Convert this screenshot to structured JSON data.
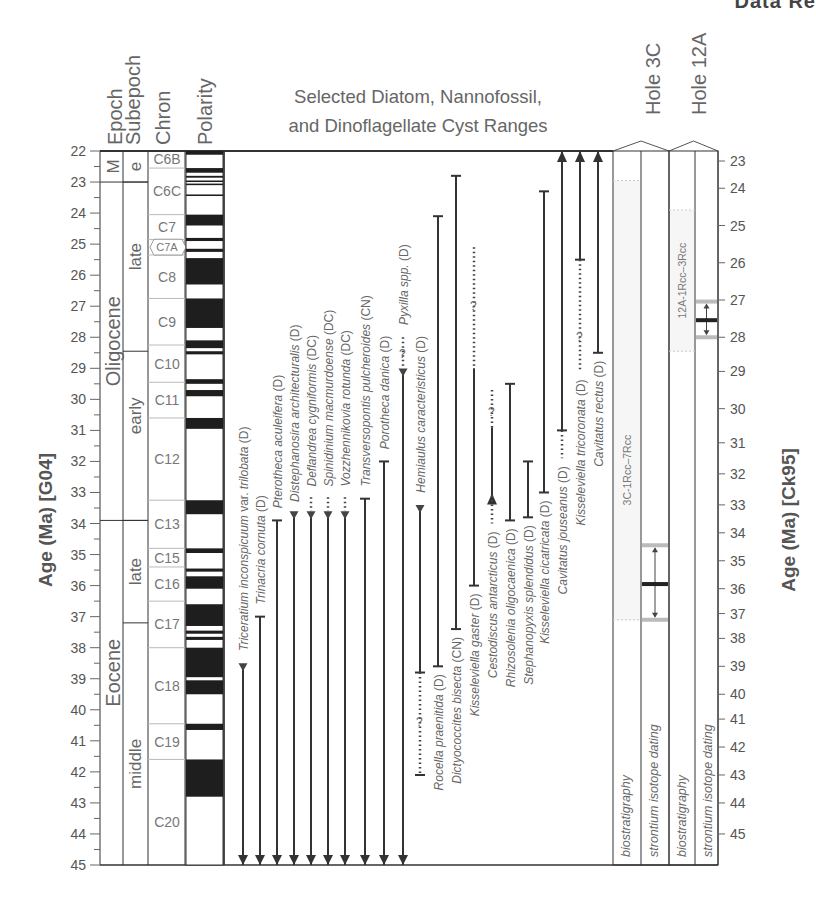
{
  "page_header_fragment": "Data Re",
  "chart_data": {
    "type": "range_chart",
    "title_lines": [
      "Selected Diatom, Nannofossil,",
      "and Dinoflagellate Cyst Ranges"
    ],
    "left_axis": {
      "label": "Age (Ma)  [G04]",
      "range": [
        22,
        45
      ],
      "ticks": [
        22,
        23,
        24,
        25,
        26,
        27,
        28,
        29,
        30,
        31,
        32,
        33,
        34,
        35,
        36,
        37,
        38,
        39,
        40,
        41,
        42,
        43,
        44,
        45
      ],
      "minor_step": 0.5
    },
    "right_axis": {
      "label": "Age (Ma)  [Ck95]",
      "ticks": [
        23,
        24,
        25,
        26,
        27,
        28,
        29,
        30,
        31,
        32,
        33,
        34,
        35,
        36,
        37,
        38,
        39,
        40,
        41,
        42,
        43,
        44,
        45
      ],
      "tick_positions_g04": [
        22.0,
        23.2,
        24.4,
        25.6,
        26.8,
        28.0,
        29.1,
        30.3,
        31.4,
        32.4,
        33.4,
        34.3,
        35.2,
        36.1,
        36.9,
        37.7,
        38.6,
        39.5,
        40.3,
        41.2,
        42.1,
        43.0,
        44.0
      ]
    },
    "column_headers": {
      "epoch": "Epoch",
      "subepoch": "Subepoch",
      "chron": "Chron",
      "polarity": "Polarity",
      "hole3c": "Hole 3C",
      "hole12a": "Hole 12A"
    },
    "epochs": [
      {
        "label": "M",
        "from": 22.0,
        "to": 23.0
      },
      {
        "label": "Oligocene",
        "from": 23.0,
        "to": 33.9
      },
      {
        "label": "Eocene",
        "from": 33.9,
        "to": 45.0
      }
    ],
    "subepochs": [
      {
        "label": "e",
        "from": 22.0,
        "to": 23.0
      },
      {
        "label": "late",
        "from": 23.0,
        "to": 28.45
      },
      {
        "label": "early",
        "from": 28.45,
        "to": 33.9
      },
      {
        "label": "late",
        "from": 33.9,
        "to": 37.2
      },
      {
        "label": "middle",
        "from": 37.2,
        "to": 45.0
      }
    ],
    "chrons": [
      {
        "label": "C6B",
        "from": 22.0,
        "to": 22.55
      },
      {
        "label": "C6C",
        "from": 22.55,
        "to": 24.05
      },
      {
        "label": "C7",
        "from": 24.05,
        "to": 24.85,
        "label_at": 24.45
      },
      {
        "label": "C7A",
        "from": 24.85,
        "to": 25.35,
        "tag": true
      },
      {
        "label": "C8",
        "from": 25.35,
        "to": 26.75
      },
      {
        "label": "C9",
        "from": 26.75,
        "to": 28.25
      },
      {
        "label": "C10",
        "from": 28.25,
        "to": 29.45
      },
      {
        "label": "C11",
        "from": 29.45,
        "to": 30.6
      },
      {
        "label": "C12",
        "from": 30.6,
        "to": 33.25
      },
      {
        "label": "C13",
        "from": 33.25,
        "to": 34.8
      },
      {
        "label": "C15",
        "from": 34.8,
        "to": 35.4
      },
      {
        "label": "C16",
        "from": 35.4,
        "to": 36.5
      },
      {
        "label": "C17",
        "from": 36.5,
        "to": 38.0
      },
      {
        "label": "C18",
        "from": 38.0,
        "to": 40.45
      },
      {
        "label": "C19",
        "from": 40.45,
        "to": 41.6
      },
      {
        "label": "C20",
        "from": 41.6,
        "to": 45.0
      }
    ],
    "polarity_normal": [
      [
        22.0,
        22.12
      ],
      [
        22.55,
        22.7
      ],
      [
        22.8,
        22.86
      ],
      [
        22.95,
        23.0
      ],
      [
        23.05,
        23.1
      ],
      [
        23.4,
        23.45
      ],
      [
        24.05,
        24.4
      ],
      [
        24.8,
        24.9
      ],
      [
        25.15,
        25.25
      ],
      [
        25.45,
        26.3
      ],
      [
        26.75,
        27.7
      ],
      [
        28.1,
        28.35
      ],
      [
        28.45,
        28.55
      ],
      [
        29.35,
        29.5
      ],
      [
        29.7,
        29.9
      ],
      [
        30.6,
        30.95
      ],
      [
        33.25,
        33.7
      ],
      [
        34.8,
        34.95
      ],
      [
        35.45,
        35.55
      ],
      [
        35.7,
        36.1
      ],
      [
        36.6,
        37.3
      ],
      [
        37.45,
        37.55
      ],
      [
        37.65,
        37.75
      ],
      [
        38.0,
        38.95
      ],
      [
        39.05,
        39.5
      ],
      [
        40.45,
        40.65
      ],
      [
        41.6,
        42.8
      ]
    ],
    "species": [
      {
        "name": "Triceratium inconspicuum var. trilobata",
        "italic_parts": [
          "Triceratium inconspicuum",
          " var. ",
          "trilobata"
        ],
        "group": "(D)",
        "x": 243,
        "top": 38.6,
        "bottom": 45.0,
        "top_end": "triangle_down",
        "bottom_end": "arrow_down",
        "label_from": 38.3
      },
      {
        "name": "Trinacria cornuta",
        "group": "(D)",
        "x": 260,
        "top": 37.0,
        "bottom": 45.0,
        "top_end": "bar",
        "bottom_end": "arrow_down",
        "label_from": 36.8
      },
      {
        "name": "Pterotheca aculeifera",
        "group": "(D)",
        "x": 277,
        "top": 33.9,
        "bottom": 45.0,
        "top_end": "bar",
        "bottom_end": "arrow_down",
        "label_from": 33.7
      },
      {
        "name": "Distephanosira architecturalis",
        "group": "(D)",
        "x": 294,
        "top": 33.7,
        "bottom": 45.0,
        "top_end": "triangle_down",
        "bottom_end": "arrow_down",
        "label_from": 33.5
      },
      {
        "name": "Deflandrea cygniformis",
        "group": "(DC)",
        "x": 311,
        "top": 33.7,
        "bottom": 45.0,
        "top_end": "triangle_down",
        "bottom_end": "arrow_down",
        "dotted_to": 33.15,
        "label_from": 33.0
      },
      {
        "name": "Spinidinium macmurdoense",
        "group": "(DC)",
        "x": 328,
        "top": 33.7,
        "bottom": 45.0,
        "top_end": "triangle_down",
        "bottom_end": "arrow_down",
        "dotted_to": 33.15,
        "label_from": 33.0
      },
      {
        "name": "Vozzhennikovia rotunda",
        "group": "(DC)",
        "x": 345,
        "top": 33.7,
        "bottom": 45.0,
        "top_end": "triangle_down",
        "bottom_end": "arrow_down",
        "dotted_to": 33.15,
        "label_from": 33.0
      },
      {
        "name": "Transversopontis pulcheroides",
        "group": "(CN)",
        "x": 365,
        "top": 33.2,
        "bottom": 45.0,
        "top_end": "bar",
        "bottom_end": "arrow_down",
        "label_from": 33.0
      },
      {
        "name": "Porotheca danica",
        "group": "(D)",
        "x": 384,
        "top": 32.0,
        "bottom": 45.0,
        "top_end": "bar",
        "bottom_end": "arrow_down",
        "label_from": 31.8
      },
      {
        "name": "Pyxilla spp.",
        "group": "(D)",
        "x": 403,
        "top": 29.1,
        "bottom": 45.0,
        "top_end": "triangle_down",
        "bottom_end": "arrow_down",
        "dotted_to": 28.0,
        "question": 28.55,
        "label_from": 27.8
      },
      {
        "name": "Hemiaulus caracteristicus",
        "group": "(D)",
        "x": 420,
        "top": 33.5,
        "bottom": 38.8,
        "top_end": "triangle_down",
        "bottom_end": "bar",
        "dotted_bottom_to": 42.1,
        "question_bottom": 40.4,
        "label_from": 33.2
      },
      {
        "name": "Rocella praenitida",
        "group": "(D)",
        "x": 438,
        "top": 24.1,
        "bottom": 38.6,
        "top_end": "bar",
        "bottom_end": "bar",
        "label_below": true
      },
      {
        "name": "Dictyococcites bisecta",
        "group": "(CN)",
        "x": 456,
        "top": 22.8,
        "bottom": 37.4,
        "top_end": "bar",
        "bottom_end": "bar",
        "label_below": true
      },
      {
        "name": "Kisseleviella gaster",
        "group": "(D)",
        "x": 474,
        "top": 29.0,
        "bottom": 36.0,
        "top_end": "none",
        "bottom_end": "bar",
        "dotted_to": 25.1,
        "question": 27.0,
        "label_below": true
      },
      {
        "name": "Cestodiscus antarcticus",
        "group": "(D)",
        "x": 492,
        "top": 30.9,
        "bottom": 33.1,
        "top_end": "none",
        "bottom_end": "arrow_up_small",
        "dotted_to": 29.7,
        "question": 30.4,
        "dotted_bottom_to": 34.0,
        "label_below": true
      },
      {
        "name": "Rhizosolenia oligocaenica",
        "group": "(D)",
        "x": 510,
        "top": 29.5,
        "bottom": 33.9,
        "top_end": "bar",
        "bottom_end": "bar",
        "label_below": true
      },
      {
        "name": "Stephanopyxis splendidus",
        "group": "(D)",
        "x": 528,
        "top": 32.0,
        "bottom": 33.8,
        "top_end": "bar",
        "bottom_end": "bar",
        "label_below": true
      },
      {
        "name": "Kisseleviella cicatricata",
        "group": "(D)",
        "x": 544,
        "top": 23.3,
        "bottom": 33.0,
        "top_end": "bar",
        "bottom_end": "bar",
        "label_below": true
      },
      {
        "name": "Cavitatus jouseanus",
        "group": "(D)",
        "x": 562,
        "top": 22.0,
        "bottom": 31.0,
        "top_end": "arrow_up",
        "bottom_end": "bar",
        "dotted_bottom_to": 31.9,
        "label_below": true
      },
      {
        "name": "Kisseleviella tricoronata",
        "group": "(D)",
        "x": 580,
        "top": 22.0,
        "bottom": 25.5,
        "top_end": "arrow_up",
        "bottom_end": "bar",
        "dotted_bottom_to": 29.1,
        "question_bottom": 28.0,
        "label_below": true
      },
      {
        "name": "Cavitatus rectus",
        "group": "(D)",
        "x": 598,
        "top": 22.0,
        "bottom": 28.5,
        "top_end": "arrow_up",
        "bottom_end": "bar",
        "label_below": true
      }
    ],
    "holes": [
      {
        "name": "Hole 3C",
        "columns": [
          "biostratigraphy",
          "strontium isotope dating"
        ],
        "bio_range_label": "3C-1Rcc–7Rcc",
        "bio_range": [
          22.95,
          37.1
        ],
        "sr_range": [
          34.7,
          37.1
        ],
        "sr_mid": 35.95
      },
      {
        "name": "Hole 12A",
        "columns": [
          "biostratigraphy",
          "strontium isotope dating"
        ],
        "bio_range_label": "12A-1Rcc–3Rcc",
        "bio_range": [
          23.9,
          28.45
        ],
        "sr_range": [
          26.85,
          28.0
        ],
        "sr_mid": 27.45
      }
    ]
  }
}
